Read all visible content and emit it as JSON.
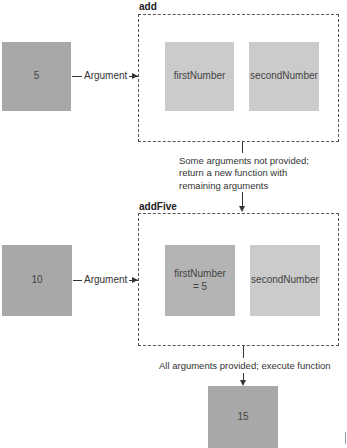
{
  "stage1": {
    "input_value": "5",
    "arg_label": "Argument",
    "function_name": "add",
    "params": [
      {
        "label": "firstNumber"
      },
      {
        "label": "secondNumber"
      }
    ]
  },
  "transition1": {
    "lines": [
      "Some arguments not provided;",
      "return a new function  with",
      "remaining arguments"
    ]
  },
  "stage2": {
    "input_value": "10",
    "arg_label": "Argument",
    "function_name": "addFive",
    "params": [
      {
        "label": "firstNumber",
        "value": "= 5"
      },
      {
        "label": "secondNumber"
      }
    ]
  },
  "transition2": {
    "text": "All arguments provided; execute function"
  },
  "result": {
    "value": "15"
  },
  "colors": {
    "input_box": "#a8a8a8",
    "bound_param": "#b4b4b4",
    "param_box": "#cbcbcb",
    "dashed_border": "#555555"
  }
}
